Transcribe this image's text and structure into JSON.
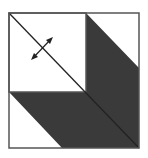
{
  "diagram": {
    "colors": {
      "background": "#ffffff",
      "dark_fill": "#3a3a3a",
      "outline": "#555555",
      "line": "#222222"
    },
    "elements": {
      "outer_square": "square border",
      "light_square": "upper-left white square",
      "dark_band": "L-shaped dark parallelogram band",
      "diagonal_line": "corner-to-corner diagonal",
      "double_arrow": "bidirectional arrow perpendicular to diagonal"
    }
  }
}
